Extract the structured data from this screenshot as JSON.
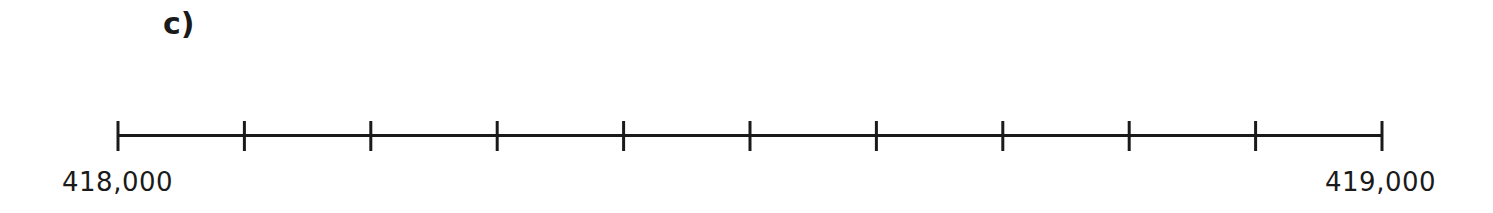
{
  "part_label": "c)",
  "number_line": {
    "start_label": "418,000",
    "end_label": "419,000",
    "start_value": 418000,
    "end_value": 419000,
    "tick_count": 11,
    "line_color": "#1a1a1a"
  }
}
